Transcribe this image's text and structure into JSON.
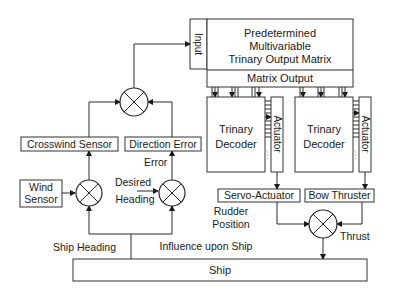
{
  "diagram": {
    "blocks": {
      "input": "Input",
      "matrix_line1": "Predetermined",
      "matrix_line2": "Multivariable",
      "matrix_line3": "Trinary Output Matrix",
      "matrix_output": "Matrix Output",
      "decoder_left_line1": "Trinary",
      "decoder_left_line2": "Decoder",
      "actuator_left": "Actuator",
      "decoder_right_line1": "Trinary",
      "decoder_right_line2": "Decoder",
      "actuator_right": "Actuator",
      "crosswind_sensor": "Crosswind Sensor",
      "direction_error": "Direction Error",
      "wind_sensor_line1": "Wind",
      "wind_sensor_line2": "Sensor",
      "servo_actuator": "Servo-Actuator",
      "bow_thruster": "Bow Thruster",
      "ship": "Ship"
    },
    "labels": {
      "error": "Error",
      "desired_line1": "Desired",
      "desired_line2": "Heading",
      "ship_heading": "Ship Heading",
      "rudder_line1": "Rudder",
      "rudder_line2": "Position",
      "thrust": "Thrust",
      "influence": "Influence upon Ship",
      "dots": ". . ."
    },
    "colors": {
      "line": "#2a2a2a",
      "box_border": "#333333",
      "background": "#ffffff"
    }
  }
}
